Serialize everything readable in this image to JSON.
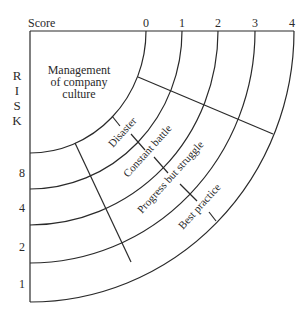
{
  "diagram": {
    "score_axis": {
      "title": "Score",
      "ticks": [
        "0",
        "1",
        "2",
        "3",
        "4"
      ]
    },
    "risk_axis": {
      "title_letters": [
        "R",
        "I",
        "S",
        "K"
      ],
      "ticks": [
        "8",
        "4",
        "2",
        "1"
      ]
    },
    "center_label": [
      "Management",
      "of company",
      "culture"
    ],
    "band_labels": [
      "Disaster",
      "Constant battle",
      "Progress but struggle",
      "Best practice"
    ],
    "colors": {
      "line": "#2a2a2a",
      "background": "#ffffff"
    }
  }
}
